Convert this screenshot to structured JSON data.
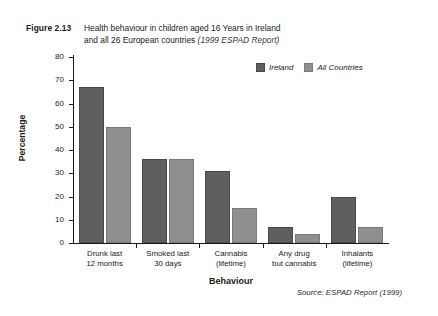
{
  "figure": {
    "number": "Figure 2.13",
    "title_line1": "Health behaviour in children aged 16 Years in Ireland",
    "title_line2": "and all 26 European countries",
    "title_note": "(1999 ESPAD Report)"
  },
  "source": "Source: ESPAD Report (1999)",
  "legend": {
    "items": [
      {
        "label": "Ireland",
        "color": "#5f5f5f"
      },
      {
        "label": "All Countries",
        "color": "#8f8f8f"
      }
    ]
  },
  "axes": {
    "y_title": "Percentage",
    "x_title": "Behaviour",
    "y_ticks": [
      "0",
      "10",
      "20",
      "30",
      "40",
      "50",
      "60",
      "70",
      "80"
    ]
  },
  "categories_display": [
    {
      "line1": "Drunk last",
      "line2": "12 months"
    },
    {
      "line1": "Smoked last",
      "line2": "30 days"
    },
    {
      "line1": "Cannabis",
      "line2": "(lifetime)"
    },
    {
      "line1": "Any drug",
      "line2": "but cannabis"
    },
    {
      "line1": "Inhalants",
      "line2": "(lifetime)"
    }
  ],
  "chart_data": {
    "type": "bar",
    "title": "Health behaviour in children aged 16 Years in Ireland and all 26 European countries (1999 ESPAD Report)",
    "xlabel": "Behaviour",
    "ylabel": "Percentage",
    "ylim": [
      0,
      80
    ],
    "ytick_step": 10,
    "grid": false,
    "legend_position": "top-right",
    "categories": [
      "Drunk last 12 months",
      "Smoked last 30 days",
      "Cannabis (lifetime)",
      "Any drug but cannabis",
      "Inhalants (lifetime)"
    ],
    "series": [
      {
        "name": "Ireland",
        "color": "#5f5f5f",
        "values": [
          67,
          36,
          31,
          7,
          20
        ]
      },
      {
        "name": "All Countries",
        "color": "#8f8f8f",
        "values": [
          50,
          36,
          15,
          4,
          7
        ]
      }
    ]
  }
}
